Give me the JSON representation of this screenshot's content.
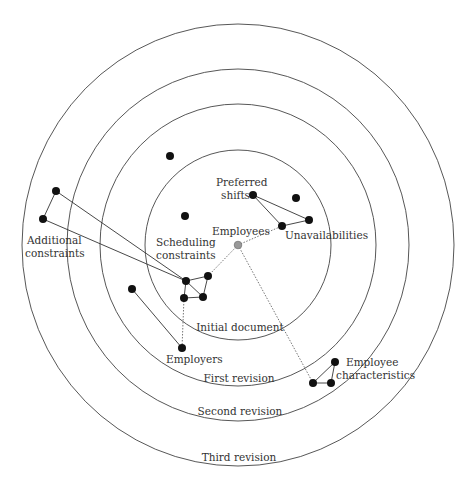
{
  "diagram": {
    "center": {
      "x": 238,
      "y": 245,
      "label": "Employees",
      "color": "#999999"
    },
    "rings": [
      {
        "id": "initial",
        "label": "Initial document",
        "rx": 93,
        "ry": 95,
        "label_y": 330
      },
      {
        "id": "first",
        "label": "First revision",
        "rx": 138,
        "ry": 141,
        "label_y": 381
      },
      {
        "id": "second",
        "label": "Second revision",
        "rx": 171,
        "ry": 176,
        "label_y": 415
      },
      {
        "id": "third",
        "label": "Third revision",
        "rx": 216,
        "ry": 221,
        "label_y": 461
      }
    ],
    "labels": {
      "preferred_1": "Preferred",
      "preferred_2": "shifts",
      "employees": "Employees",
      "unavailabilities": "Unavailabilities",
      "scheduling_1": "Scheduling",
      "scheduling_2": "constraints",
      "additional_1": "Additional",
      "additional_2": "constraints",
      "employers": "Employers",
      "employee_char_1": "Employee",
      "employee_char_2": "characteristics"
    },
    "nodes": [
      {
        "id": "n1",
        "x": 170,
        "y": 156
      },
      {
        "id": "n2",
        "x": 185,
        "y": 216
      },
      {
        "id": "pref",
        "x": 253,
        "y": 195
      },
      {
        "id": "n3",
        "x": 296,
        "y": 198
      },
      {
        "id": "unav1",
        "x": 282,
        "y": 226
      },
      {
        "id": "unav2",
        "x": 309,
        "y": 220
      },
      {
        "id": "add1",
        "x": 56,
        "y": 191
      },
      {
        "id": "add2",
        "x": 43,
        "y": 219
      },
      {
        "id": "sc1",
        "x": 186,
        "y": 281
      },
      {
        "id": "sc2",
        "x": 208,
        "y": 276
      },
      {
        "id": "sc3",
        "x": 184,
        "y": 298
      },
      {
        "id": "sc4",
        "x": 203,
        "y": 297
      },
      {
        "id": "emp0",
        "x": 132,
        "y": 289
      },
      {
        "id": "emp",
        "x": 182,
        "y": 348
      },
      {
        "id": "ec1",
        "x": 335,
        "y": 362
      },
      {
        "id": "ec2",
        "x": 313,
        "y": 383
      },
      {
        "id": "ec3",
        "x": 331,
        "y": 383
      }
    ],
    "edges": [
      [
        "pref",
        "unav1"
      ],
      [
        "pref",
        "unav2"
      ],
      [
        "unav1",
        "unav2"
      ],
      [
        "add1",
        "add2"
      ],
      [
        "add1",
        "sc1"
      ],
      [
        "add2",
        "sc1"
      ],
      [
        "sc1",
        "sc2"
      ],
      [
        "sc1",
        "sc3"
      ],
      [
        "sc1",
        "sc4"
      ],
      [
        "sc2",
        "sc4"
      ],
      [
        "sc3",
        "sc4"
      ],
      [
        "emp0",
        "emp"
      ],
      [
        "ec1",
        "ec2"
      ],
      [
        "ec2",
        "ec3"
      ],
      [
        "ec1",
        "ec3"
      ]
    ],
    "dotted_edges": [
      [
        "center",
        "unav1"
      ],
      [
        "center",
        "sc2"
      ],
      [
        "center",
        "ec2"
      ],
      [
        "sc3",
        "emp"
      ]
    ]
  }
}
